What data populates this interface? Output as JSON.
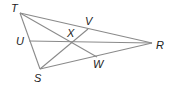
{
  "diagram": {
    "type": "triangle-medians",
    "labels": {
      "T": "T",
      "R": "R",
      "S": "S",
      "U": "U",
      "V": "V",
      "W": "W",
      "X": "X"
    },
    "points": {
      "T": [
        20,
        13
      ],
      "R": [
        152,
        43
      ],
      "S": [
        40,
        69
      ],
      "U": [
        29,
        41
      ],
      "V": [
        88,
        29
      ],
      "W": [
        97,
        57
      ],
      "X": [
        71,
        42
      ]
    },
    "segments": [
      [
        "T",
        "R"
      ],
      [
        "R",
        "S"
      ],
      [
        "S",
        "T"
      ],
      [
        "T",
        "W"
      ],
      [
        "U",
        "R"
      ],
      [
        "S",
        "V"
      ]
    ],
    "line_color": "#888888"
  }
}
